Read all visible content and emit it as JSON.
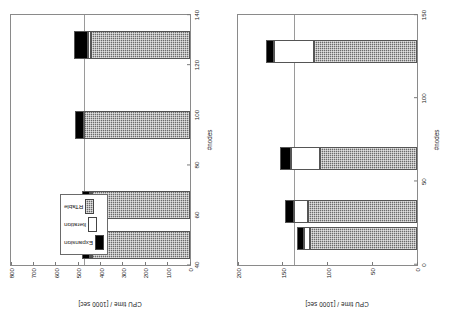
{
  "figure": {
    "legend": {
      "entries": [
        {
          "label": "Expansion",
          "color": "#000000",
          "pattern": "solid-black"
        },
        {
          "label": "Iteration",
          "color": "#ffffff",
          "pattern": "solid-white"
        },
        {
          "label": "RTable",
          "color": "#6b6b6b",
          "pattern": "crosshatch-gray"
        }
      ]
    }
  },
  "chart_data": [
    {
      "id": "left",
      "type": "bar",
      "orientation": "vertical-stacked",
      "title": "",
      "xlabel": "#nodes",
      "ylabel": "CPU time / [1000 sec]",
      "xlim": [
        40,
        140
      ],
      "ylim": [
        0,
        800
      ],
      "xticks": [
        40,
        60,
        80,
        100,
        120,
        140
      ],
      "yticks": [
        0,
        100,
        200,
        300,
        400,
        500,
        600,
        700,
        800
      ],
      "grid": false,
      "refline_y": 470,
      "legend_position": "inside-lower-left",
      "categories": [
        48,
        64,
        96,
        128
      ],
      "bar_width_units": 11,
      "series": [
        {
          "name": "RTable",
          "values": [
            437,
            437,
            472,
            442
          ]
        },
        {
          "name": "Iteration",
          "values": [
            10,
            10,
            3,
            14
          ]
        },
        {
          "name": "Expansion",
          "values": [
            38,
            38,
            41,
            64
          ]
        }
      ],
      "totals": [
        485,
        485,
        516,
        520
      ]
    },
    {
      "id": "right",
      "type": "bar",
      "orientation": "vertical-stacked",
      "title": "",
      "xlabel": "#nodes",
      "ylabel": "CPU time / [1000 sec]",
      "xlim": [
        0,
        150
      ],
      "ylim": [
        0,
        200
      ],
      "xticks": [
        0,
        50,
        100,
        150
      ],
      "yticks": [
        0,
        50,
        100,
        150,
        200
      ],
      "grid": false,
      "refline_y": 136,
      "legend_position": "none",
      "categories": [
        16,
        32,
        64,
        128
      ],
      "bar_width_units": 14,
      "series": [
        {
          "name": "RTable",
          "values": [
            120,
            122,
            108,
            115
          ]
        },
        {
          "name": "Iteration",
          "values": [
            6,
            16,
            33,
            45
          ]
        },
        {
          "name": "Expansion",
          "values": [
            8,
            10,
            12,
            9
          ]
        }
      ],
      "totals": [
        134,
        148,
        153,
        169
      ]
    }
  ]
}
